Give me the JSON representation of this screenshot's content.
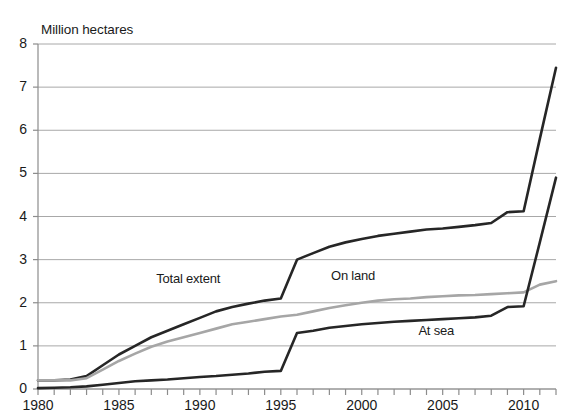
{
  "chart_data": {
    "type": "line",
    "title": "Million hectares",
    "xlabel": "",
    "ylabel": "Million hectares",
    "xlim": [
      1980,
      2012
    ],
    "ylim": [
      0,
      8
    ],
    "ytick_step": 1,
    "xtick_step": 1,
    "xlabel_step": 5,
    "grid": true,
    "legend_position": "inline-labels",
    "yticks": [
      "0",
      "1",
      "2",
      "3",
      "4",
      "5",
      "6",
      "7",
      "8"
    ],
    "xticks": [
      "1980",
      "1985",
      "1990",
      "1995",
      "2000",
      "2005",
      "2010"
    ],
    "x": [
      1980,
      1981,
      1982,
      1983,
      1984,
      1985,
      1986,
      1987,
      1988,
      1989,
      1990,
      1991,
      1992,
      1993,
      1994,
      1995,
      1996,
      1997,
      1998,
      1999,
      2000,
      2001,
      2002,
      2003,
      2004,
      2005,
      2006,
      2007,
      2008,
      2009,
      2010,
      2011,
      2012
    ],
    "series": [
      {
        "name": "Total extent",
        "color": "#262626",
        "width": 2.6,
        "label_x": 1989.4,
        "label_y": 2.55,
        "values": [
          0.2,
          0.2,
          0.22,
          0.3,
          0.55,
          0.8,
          1.0,
          1.2,
          1.35,
          1.5,
          1.65,
          1.8,
          1.9,
          1.98,
          2.05,
          2.1,
          3.0,
          3.15,
          3.3,
          3.4,
          3.48,
          3.55,
          3.6,
          3.65,
          3.7,
          3.72,
          3.76,
          3.8,
          3.85,
          4.1,
          4.12,
          5.8,
          7.45
        ]
      },
      {
        "name": "On land",
        "color": "#a6a6a6",
        "width": 2.6,
        "label_x": 2000.2,
        "label_y": 2.62,
        "values": [
          0.2,
          0.2,
          0.2,
          0.25,
          0.45,
          0.65,
          0.82,
          0.98,
          1.1,
          1.2,
          1.3,
          1.4,
          1.5,
          1.56,
          1.62,
          1.68,
          1.72,
          1.8,
          1.88,
          1.94,
          2.0,
          2.05,
          2.08,
          2.1,
          2.13,
          2.15,
          2.17,
          2.18,
          2.2,
          2.22,
          2.24,
          2.42,
          2.5
        ]
      },
      {
        "name": "At sea",
        "color": "#262626",
        "width": 2.6,
        "label_x": 2005.6,
        "label_y": 1.34,
        "values": [
          0.02,
          0.03,
          0.04,
          0.06,
          0.1,
          0.14,
          0.18,
          0.2,
          0.22,
          0.25,
          0.28,
          0.3,
          0.33,
          0.36,
          0.4,
          0.42,
          1.3,
          1.35,
          1.42,
          1.46,
          1.5,
          1.53,
          1.56,
          1.58,
          1.6,
          1.62,
          1.64,
          1.66,
          1.7,
          1.9,
          1.92,
          3.4,
          4.9
        ]
      }
    ]
  }
}
